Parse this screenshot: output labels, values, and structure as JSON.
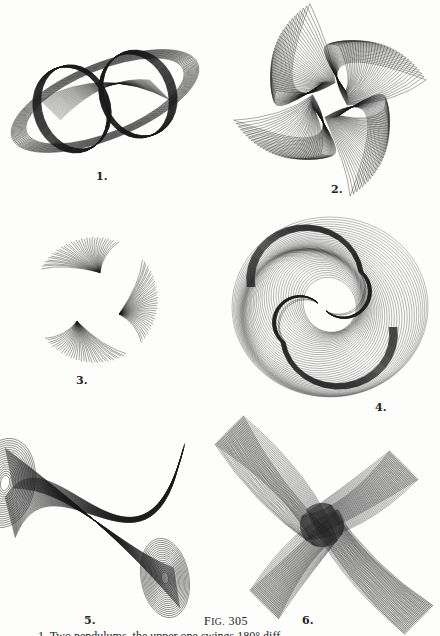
{
  "page": {
    "figure_caption_prefix": "F",
    "figure_caption_smallcaps": "IG.",
    "figure_number": "305",
    "bottom_text": "1. Two pendulums, the upper one swings 180° diff..."
  },
  "figures": [
    {
      "label": "1.",
      "description": "Two overlapping ellipses with nested elliptical outer loops (harmonograph tracing)"
    },
    {
      "label": "2.",
      "description": "Four-bladed pinwheel of fanned loops (harmonograph tracing)"
    },
    {
      "label": "3.",
      "description": "Three-lobed twisting fan figure around an open center (harmonograph tracing)"
    },
    {
      "label": "4.",
      "description": "Yin-yang-like double spiral of concentric loops (harmonograph tracing)"
    },
    {
      "label": "5.",
      "description": "Twisted band forming a figure-eight with fanned ends (harmonograph tracing)"
    },
    {
      "label": "6.",
      "description": "Four-pointed twisting star of fanned loops (harmonograph tracing)"
    }
  ],
  "colors": {
    "ink": "#1a1a1a",
    "paper": "#fdfdfc"
  }
}
